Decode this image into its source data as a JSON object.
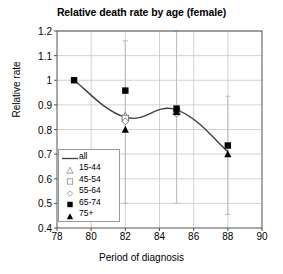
{
  "chart_data": {
    "type": "line",
    "title": "Relative death rate by age (female)",
    "xlabel": "Period of diagnosis",
    "ylabel": "Relative rate",
    "xlim": [
      78,
      90
    ],
    "ylim": [
      0.4,
      1.2
    ],
    "xticks": [
      78,
      80,
      82,
      84,
      86,
      88,
      90
    ],
    "yticks": [
      "1.2",
      "1.1",
      "1",
      "0.9",
      "0.8",
      "0.7",
      "0.6",
      "0.5",
      "0.4"
    ],
    "grid": "both",
    "legend_position": "inside-bottom-left",
    "series": [
      {
        "name": "all",
        "marker": "line",
        "x": [
          79,
          82,
          85,
          88
        ],
        "values": [
          1.0,
          0.85,
          0.88,
          0.71
        ]
      },
      {
        "name": "15-44",
        "marker": "open-triangle",
        "x": [
          82,
          85
        ],
        "values": [
          0.855,
          0.875
        ]
      },
      {
        "name": "45-54",
        "marker": "open-square",
        "x": [
          82,
          85
        ],
        "values": [
          0.845,
          0.872
        ]
      },
      {
        "name": "55-64",
        "marker": "open-diamond",
        "x": [
          82,
          85
        ],
        "values": [
          0.833,
          0.865
        ]
      },
      {
        "name": "65-74",
        "marker": "filled-square",
        "x": [
          79,
          82,
          85,
          88
        ],
        "values": [
          1.0,
          0.958,
          0.885,
          0.735
        ]
      },
      {
        "name": "75+",
        "marker": "filled-triangle",
        "x": [
          82,
          85,
          88
        ],
        "values": [
          0.8,
          0.872,
          0.7
        ]
      }
    ],
    "error_bars": [
      {
        "x": 82,
        "low": 0.5,
        "high": 1.16
      },
      {
        "x": 85,
        "low": 0.5,
        "high": 1.2
      },
      {
        "x": 88,
        "low": 0.455,
        "high": 0.935
      }
    ]
  },
  "legend": {
    "items": [
      {
        "label": "all",
        "marker": "line"
      },
      {
        "label": "15-44",
        "marker": "open-triangle"
      },
      {
        "label": "45-54",
        "marker": "open-square"
      },
      {
        "label": "55-64",
        "marker": "open-diamond"
      },
      {
        "label": "65-74",
        "marker": "filled-square"
      },
      {
        "label": "75+",
        "marker": "filled-triangle"
      }
    ]
  },
  "colors": {
    "axis": "#555555",
    "grid": "#c8c8c8",
    "series_line": "#404040",
    "marker": "#000000",
    "error_bar": "#bfbfbf"
  }
}
